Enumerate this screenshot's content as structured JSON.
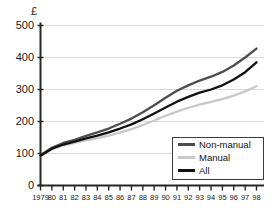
{
  "chart_data": {
    "type": "line",
    "title": "",
    "subtitle": "",
    "xlabel": "",
    "ylabel": "",
    "unit_label": "£",
    "grid": true,
    "legend_position": "bottom-right",
    "xlim": [
      1979,
      1998
    ],
    "ylim": [
      0,
      500
    ],
    "ytick_values": [
      0,
      100,
      200,
      300,
      400,
      500
    ],
    "ytick_labels": [
      "0",
      "100",
      "200",
      "300",
      "400",
      "500"
    ],
    "x": [
      1979,
      1980,
      1981,
      1982,
      1983,
      1984,
      1985,
      1986,
      1987,
      1988,
      1989,
      1990,
      1991,
      1992,
      1993,
      1994,
      1995,
      1996,
      1997,
      1998
    ],
    "xtick_labels": [
      "1979",
      "80",
      "81",
      "82",
      "83",
      "84",
      "85",
      "86",
      "87",
      "88",
      "89",
      "90",
      "91",
      "92",
      "93",
      "94",
      "95",
      "96",
      "97",
      "98"
    ],
    "series": [
      {
        "name": "Non-manual",
        "color": "#4d4d4d",
        "values": [
          95,
          118,
          133,
          143,
          155,
          166,
          178,
          193,
          209,
          229,
          251,
          274,
          296,
          313,
          328,
          340,
          355,
          375,
          400,
          428
        ]
      },
      {
        "name": "Manual",
        "color": "#c8c8c8",
        "values": [
          92,
          113,
          125,
          133,
          141,
          148,
          156,
          165,
          176,
          189,
          203,
          218,
          231,
          243,
          253,
          261,
          270,
          281,
          294,
          310
        ]
      },
      {
        "name": "All",
        "color": "#111111",
        "values": [
          93,
          115,
          128,
          137,
          147,
          156,
          166,
          178,
          191,
          207,
          225,
          244,
          262,
          277,
          290,
          300,
          313,
          331,
          354,
          385
        ]
      }
    ]
  },
  "legend": {
    "items": [
      {
        "label": "Non-manual",
        "color": "#4d4d4d"
      },
      {
        "label": "Manual",
        "color": "#c8c8c8"
      },
      {
        "label": "All",
        "color": "#111111"
      }
    ]
  }
}
